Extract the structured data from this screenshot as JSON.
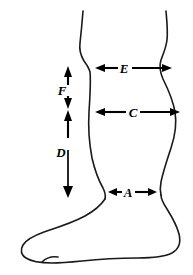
{
  "figure": {
    "orientation": "left-facing foot profile",
    "line_color": "#1a1a1a",
    "arrow_color": "#000000",
    "background_color": "#ffffff"
  },
  "dimensions": [
    {
      "id": "E",
      "label": "E",
      "kind": "horizontal",
      "description": "Width across leg just below the knee",
      "x1": 95,
      "x2": 172,
      "y": 68,
      "label_x": 124,
      "label_y": 72
    },
    {
      "id": "C",
      "label": "C",
      "kind": "horizontal",
      "description": "Maximum calf width",
      "x1": 95,
      "x2": 180,
      "y": 112,
      "label_x": 132,
      "label_y": 116
    },
    {
      "id": "A",
      "label": "A",
      "kind": "horizontal",
      "description": "Ankle width",
      "x1": 108,
      "x2": 157,
      "y": 192,
      "label_x": 128,
      "label_y": 196
    },
    {
      "id": "F",
      "label": "F",
      "kind": "vertical",
      "description": "Short vertical height segment above D",
      "x": 68,
      "y1": 67,
      "y2": 108,
      "label_x": 62,
      "label_y": 92
    },
    {
      "id": "D",
      "label": "D",
      "kind": "vertical",
      "description": "Overall leg height from below knee to ankle",
      "x": 68,
      "y1": 110,
      "y2": 198,
      "label_x": 61,
      "label_y": 152
    }
  ],
  "label_values": {
    "A": "A",
    "C": "C",
    "D": "D",
    "E": "E",
    "F": "F"
  }
}
